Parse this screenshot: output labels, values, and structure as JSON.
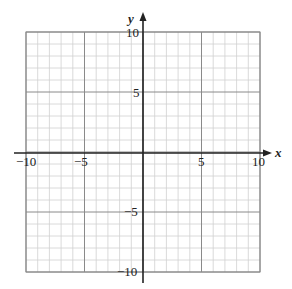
{
  "chart_data": {
    "type": "scatter",
    "title": "",
    "xlabel": "x",
    "ylabel": "y",
    "xlim": [
      -10,
      10
    ],
    "ylim": [
      -10,
      10
    ],
    "grid": true,
    "grid_minor_step": 1,
    "grid_major_step": 5,
    "x_ticks": [
      -10,
      -5,
      5,
      10
    ],
    "y_ticks": [
      10,
      5,
      -5,
      -10
    ],
    "x_tick_labels": [
      "−10",
      "−5",
      "5",
      "10"
    ],
    "y_tick_labels": [
      "10",
      "5",
      "−5",
      "−10"
    ],
    "series": []
  },
  "labels": {
    "x_axis": "x",
    "y_axis": "y",
    "x_neg10": "−10",
    "x_neg5": "−5",
    "x_5": "5",
    "x_10": "10",
    "y_10": "10",
    "y_5": "5",
    "y_neg5": "−5",
    "y_neg10": "−10"
  },
  "colors": {
    "minor_grid": "#d0d0d0",
    "major_grid": "#8a8a8a",
    "axis": "#222222"
  }
}
